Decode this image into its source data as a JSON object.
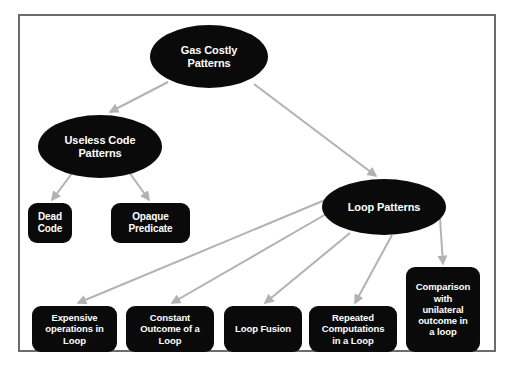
{
  "diagram": {
    "title": "Gas Costly Patterns",
    "type": "tree-diagram",
    "frame_border_color": "#6b6b6b",
    "node_fill_color": "#0a0a0a",
    "node_text_color": "#ffffff",
    "edge_color": "#b2b2b2",
    "background_color": "#ffffff"
  },
  "nodes": {
    "root": {
      "id": "gas-costly-patterns",
      "label": "Gas Costly\nPatterns",
      "shape": "ellipse"
    },
    "useless_code_patterns": {
      "id": "useless-code-patterns",
      "label": "Useless Code\nPatterns",
      "shape": "ellipse"
    },
    "loop_patterns": {
      "id": "loop-patterns",
      "label": "Loop Patterns",
      "shape": "ellipse"
    },
    "dead_code": {
      "id": "dead-code",
      "label": "Dead\nCode",
      "shape": "rounded-rect"
    },
    "opaque_predicate": {
      "id": "opaque-predicate",
      "label": "Opaque\nPredicate",
      "shape": "rounded-rect"
    },
    "expensive_operations": {
      "id": "expensive-operations-in-loop",
      "label": "Expensive\noperations in\nLoop",
      "shape": "rounded-rect"
    },
    "constant_outcome": {
      "id": "constant-outcome-of-a-loop",
      "label": "Constant\nOutcome of a\nLoop",
      "shape": "rounded-rect"
    },
    "loop_fusion": {
      "id": "loop-fusion",
      "label": "Loop Fusion",
      "shape": "rounded-rect"
    },
    "repeated_computations": {
      "id": "repeated-computations-in-a-loop",
      "label": "Repeated\nComputations\nin a Loop",
      "shape": "rounded-rect"
    },
    "comparison_unilateral": {
      "id": "comparison-with-unilateral-outcome-in-a-loop",
      "label": "Comparison\nwith\nunilateral\noutcome in\na loop",
      "shape": "rounded-rect"
    }
  },
  "edges": [
    {
      "from": "gas-costly-patterns",
      "to": "useless-code-patterns"
    },
    {
      "from": "gas-costly-patterns",
      "to": "loop-patterns"
    },
    {
      "from": "useless-code-patterns",
      "to": "dead-code"
    },
    {
      "from": "useless-code-patterns",
      "to": "opaque-predicate"
    },
    {
      "from": "loop-patterns",
      "to": "expensive-operations-in-loop"
    },
    {
      "from": "loop-patterns",
      "to": "constant-outcome-of-a-loop"
    },
    {
      "from": "loop-patterns",
      "to": "loop-fusion"
    },
    {
      "from": "loop-patterns",
      "to": "repeated-computations-in-a-loop"
    },
    {
      "from": "loop-patterns",
      "to": "comparison-with-unilateral-outcome-in-a-loop"
    }
  ]
}
